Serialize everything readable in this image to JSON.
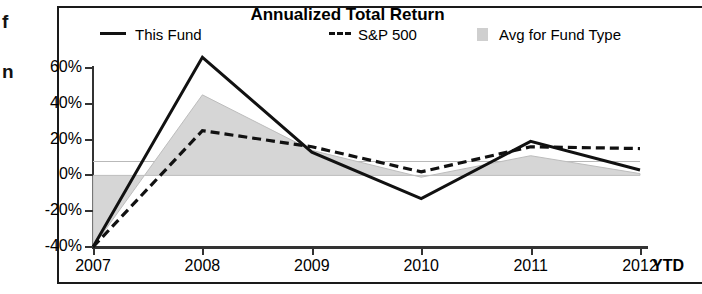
{
  "margin_fragments": [
    "f",
    "n"
  ],
  "chart": {
    "title": "Annualized Total Return",
    "ytd_label": "YTD"
  },
  "legend": [
    {
      "label": "This Fund",
      "marker": "solid-line-key",
      "color": "#111111"
    },
    {
      "label": "S&P 500",
      "marker": "dashed-line-key",
      "color": "#111111"
    },
    {
      "label": "Avg for Fund Type",
      "marker": "gray-swatch-key",
      "color": "#cfcfcf"
    }
  ],
  "chart_data": {
    "type": "line",
    "title": "Annualized Total Return",
    "xlabel": "",
    "ylabel": "",
    "categories": [
      "2007",
      "2008",
      "2009",
      "2010",
      "2011",
      "2012"
    ],
    "x_axis_note": "2012 column is year-to-date (YTD)",
    "ylim": [
      -40,
      60
    ],
    "ytick_labels": [
      "60%",
      "40%",
      "20%",
      "0%",
      "-20%",
      "-40%"
    ],
    "ytick_values": [
      60,
      40,
      20,
      0,
      -20,
      -40
    ],
    "grid": false,
    "legend_position": "top",
    "series": [
      {
        "name": "This Fund",
        "style": "solid",
        "color": "#111111",
        "values": [
          -40,
          66,
          13,
          -13,
          19,
          3
        ]
      },
      {
        "name": "S&P 500",
        "style": "dashed",
        "color": "#111111",
        "values": [
          -40,
          25,
          16,
          2,
          16,
          15
        ]
      },
      {
        "name": "Avg for Fund Type",
        "style": "filled-area",
        "color": "#d6d6d6",
        "values": [
          -40,
          45,
          14,
          -1,
          11,
          1
        ]
      }
    ]
  }
}
